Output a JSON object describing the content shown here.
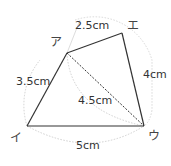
{
  "diagram": {
    "type": "quadrilateral-construction",
    "vertices": {
      "a": {
        "label": "ア",
        "x": 67,
        "y": 53
      },
      "e": {
        "label": "エ",
        "x": 122,
        "y": 33
      },
      "u": {
        "label": "ウ",
        "x": 144,
        "y": 126
      },
      "i": {
        "label": "イ",
        "x": 27,
        "y": 126
      }
    },
    "edges": {
      "ae": "2.5cm",
      "eu": "4cm",
      "ai": "3.5cm",
      "iu": "5cm",
      "au_diagonal": "4.5cm"
    },
    "colors": {
      "line": "#333333",
      "arc": "#cccccc"
    }
  }
}
